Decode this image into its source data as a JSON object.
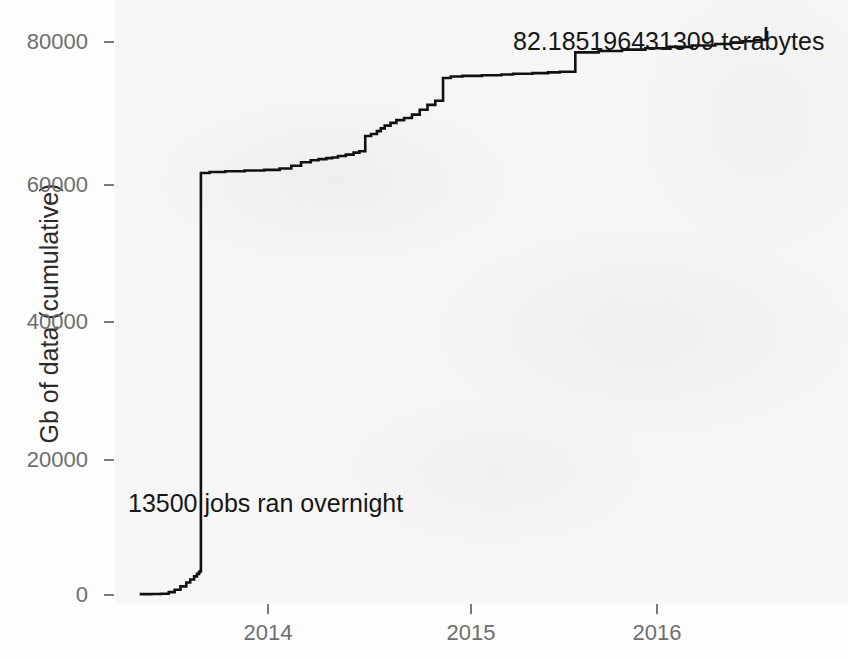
{
  "chart_data": {
    "type": "line",
    "subtype": "step",
    "title": "",
    "xlabel": "",
    "ylabel": "Gb of data (cumulative)",
    "x_tick_labels": [
      "2014",
      "2015",
      "2016"
    ],
    "x_tick_values": [
      2014,
      2015,
      2016
    ],
    "y_tick_labels": [
      "0",
      "20000",
      "40000",
      "60000",
      "80000"
    ],
    "y_tick_values": [
      0,
      20000,
      40000,
      60000,
      80000
    ],
    "xlim": [
      2013.18,
      2016.58
    ],
    "ylim": [
      -1200,
      84000
    ],
    "grid": false,
    "legend": null,
    "line_color": "#111111",
    "panel_background": "#f2f2f2",
    "series": [
      {
        "name": "Gb of data (cumulative)",
        "x": [
          2013.34,
          2013.4,
          2013.45,
          2013.49,
          2013.52,
          2013.55,
          2013.58,
          2013.6,
          2013.62,
          2013.635,
          2013.645,
          2013.65,
          2013.655,
          2013.7,
          2013.78,
          2013.88,
          2013.98,
          2014.06,
          2014.12,
          2014.17,
          2014.22,
          2014.26,
          2014.3,
          2014.33,
          2014.36,
          2014.4,
          2014.44,
          2014.47,
          2014.5,
          2014.53,
          2014.56,
          2014.58,
          2014.6,
          2014.63,
          2014.66,
          2014.7,
          2014.74,
          2014.78,
          2014.82,
          2014.86,
          2014.9,
          2014.94,
          2015.0,
          2015.1,
          2015.2,
          2015.26,
          2015.36,
          2015.44,
          2015.5,
          2015.58,
          2015.7,
          2015.82,
          2015.94,
          2016.06,
          2016.18,
          2016.3,
          2016.38,
          2016.44,
          2016.5,
          2016.56
        ],
        "y": [
          120,
          150,
          180,
          420,
          760,
          1250,
          1800,
          2250,
          2700,
          3050,
          3300,
          3450,
          61050,
          61200,
          61300,
          61400,
          61500,
          61700,
          62100,
          62600,
          62900,
          63050,
          63200,
          63300,
          63500,
          63700,
          64000,
          64200,
          66400,
          66700,
          67100,
          67500,
          67900,
          68300,
          68700,
          69000,
          69500,
          70200,
          70900,
          71500,
          74800,
          75000,
          75100,
          75200,
          75300,
          75400,
          75500,
          75600,
          75700,
          78500,
          78700,
          78900,
          79100,
          79300,
          79500,
          79700,
          79900,
          80100,
          80300,
          82185
        ]
      }
    ],
    "annotations": [
      {
        "id": "jobs-overnight",
        "text": "13500 jobs ran overnight",
        "x": 2013.66,
        "y": 14600
      },
      {
        "id": "total-terabytes",
        "text": "82.185196431309 terabytes",
        "x": 2015.42,
        "y": 81400
      }
    ]
  },
  "axes": {
    "y_label": "Gb of data (cumulative)",
    "y_ticks": [
      {
        "label": "80000",
        "top": 42
      },
      {
        "label": "60000",
        "top": 185
      },
      {
        "label": "40000",
        "top": 322
      },
      {
        "label": "20000",
        "top": 460
      },
      {
        "label": "0",
        "top": 595
      }
    ],
    "x_ticks": [
      {
        "label": "2014",
        "left": 268
      },
      {
        "label": "2015",
        "left": 471
      },
      {
        "label": "2016",
        "left": 657
      }
    ]
  },
  "annotations": {
    "jobs": "13500 jobs ran overnight",
    "terabytes": "82.185196431309 terabytes"
  },
  "colors": {
    "line": "#111111",
    "tick_text": "#6e6e6e",
    "axis_title": "#2b2b2b",
    "annotation_text": "#171717",
    "panel": "#f2f2f2"
  }
}
